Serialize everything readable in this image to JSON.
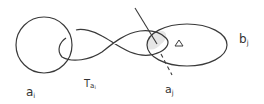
{
  "diagram": {
    "labels": {
      "circle_a_i": "a",
      "circle_a_i_sub": "i",
      "twist": "T",
      "twist_sub": "a",
      "twist_subsub": "i",
      "curve_a_j": "a",
      "curve_a_j_sub": "j",
      "curve_b_j": "b",
      "curve_b_j_sub": "j",
      "triangle": "Δ"
    },
    "colors": {
      "stroke": "#3a3a3a",
      "shade": "#e6e6e6"
    }
  }
}
